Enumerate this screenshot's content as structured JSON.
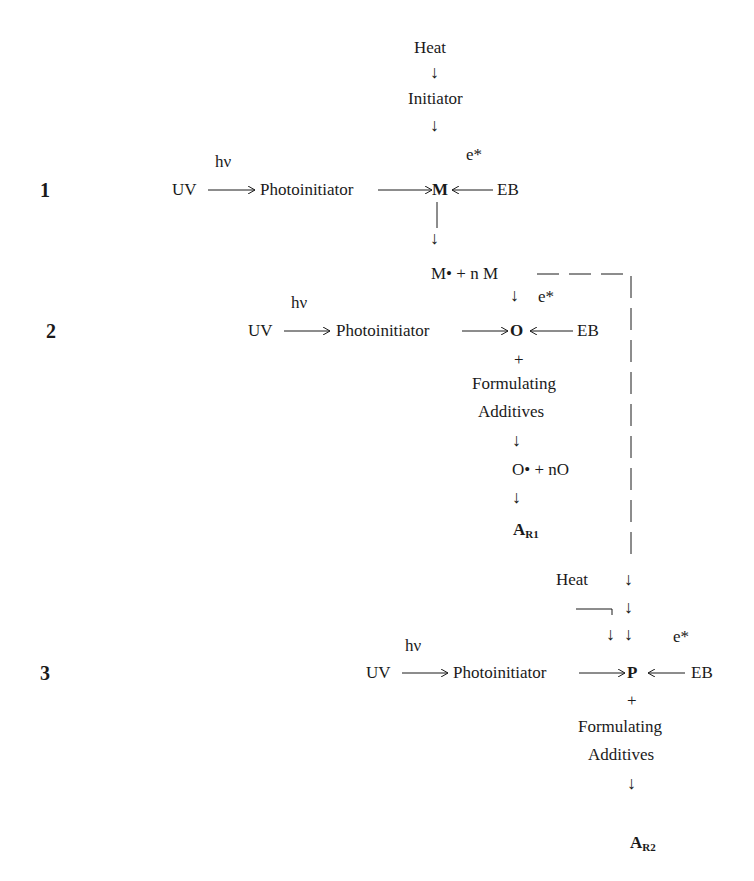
{
  "sections": {
    "s1": {
      "label": "1",
      "heat": "Heat",
      "initiator": "Initiator",
      "hv": "hν",
      "uv": "UV",
      "photoinitiator": "Photoinitiator",
      "center": "M",
      "e_star": "e*",
      "eb": "EB",
      "radical": "M•  + n M"
    },
    "s2": {
      "label": "2",
      "hv": "hν",
      "uv": "UV",
      "photoinitiator": "Photoinitiator",
      "center": "O",
      "e_star": "e*",
      "eb": "EB",
      "plus": "+",
      "additives_line1": "Formulating",
      "additives_line2": "Additives",
      "radical": "O• + nO",
      "product_main": "A",
      "product_sub": "R1"
    },
    "s3": {
      "label": "3",
      "heat": "Heat",
      "hv": "hν",
      "uv": "UV",
      "photoinitiator": "Photoinitiator",
      "center": "P",
      "e_star": "e*",
      "eb": "EB",
      "plus": "+",
      "additives_line1": "Formulating",
      "additives_line2": "Additives",
      "product_main": "A",
      "product_sub": "R2"
    }
  },
  "arrows": {
    "down": "↓"
  }
}
